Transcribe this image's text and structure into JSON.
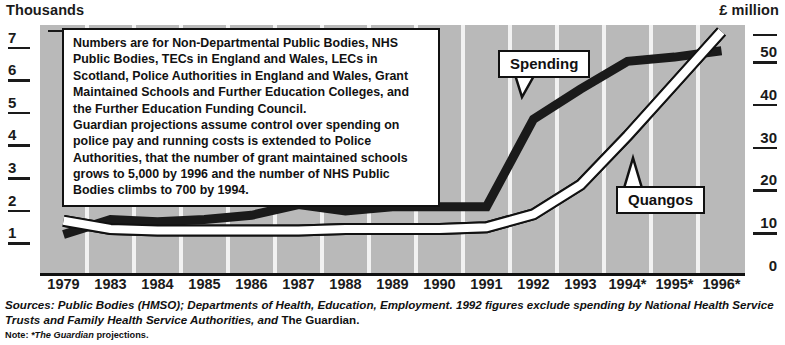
{
  "axes": {
    "left_caption": "Thousands",
    "right_caption": "£ million",
    "left_ticks": [
      "7",
      "6",
      "5",
      "4",
      "3",
      "2",
      "1"
    ],
    "right_ticks": [
      "50",
      "40",
      "30",
      "20",
      "10",
      "0"
    ],
    "x_labels": [
      "1979",
      "1983",
      "1984",
      "1985",
      "1986",
      "1987",
      "1988",
      "1989",
      "1990",
      "1991",
      "1992",
      "1993",
      "1994*",
      "1995*",
      "1996*"
    ]
  },
  "notebox": {
    "paragraph1": "Numbers are for Non-Departmental Public Bodies, NHS Public Bodies, TECs in England and Wales, LECs in Scotland, Police Authorities in England and Wales, Grant Maintained Schools and Further Education Colleges, and the Further Education Funding Council.",
    "paragraph2": "Guardian projections assume control over spending on police pay and running costs is extended to Police Authorities, that the number of grant maintained schools grows to 5,000 by 1996 and the number of NHS Public Bodies climbs to 700 by 1994."
  },
  "callouts": {
    "spending": "Spending",
    "quangos": "Quangos"
  },
  "footer": {
    "sources_italic_1": "Sources: Public Bodies (HMSO); Departments of Health, Education, Employment. 1992 figures exclude spending by National Health Service Trusts and Family Health Service Authorities, and ",
    "sources_plain": "The Guardian.",
    "note_label": "Note: ",
    "note_italic": "*The Guardian",
    "note_rest": " projections."
  },
  "colors": {
    "plot_background": "#b9b9b9",
    "gridline": "#f2f2f2",
    "spending_line": "#1a1a1a",
    "quangos_fill": "#ffffff",
    "quangos_stroke": "#111111",
    "text": "#111111"
  },
  "chart_data": {
    "type": "line",
    "title": "",
    "xlabel": "",
    "ylabel": "Thousands",
    "y2label": "£ million",
    "x": [
      "1979",
      "1983",
      "1984",
      "1985",
      "1986",
      "1987",
      "1988",
      "1989",
      "1990",
      "1991",
      "1992",
      "1993",
      "1994*",
      "1995*",
      "1996*"
    ],
    "ylim": [
      0,
      7.6
    ],
    "y2lim": [
      0,
      58
    ],
    "grid": true,
    "legend_position": "callout-annotations",
    "series": [
      {
        "name": "Quangos",
        "axis": "left",
        "unit": "thousands",
        "style": "white-filled-line",
        "values": [
          1.6,
          1.35,
          1.3,
          1.3,
          1.3,
          1.3,
          1.35,
          1.35,
          1.35,
          1.4,
          1.8,
          2.7,
          4.2,
          5.8,
          7.4
        ]
      },
      {
        "name": "Spending",
        "axis": "right",
        "unit": "£ million",
        "style": "thick-dark-line",
        "values": [
          9.0,
          12.5,
          12.0,
          12.5,
          13.5,
          16.0,
          14.5,
          15.5,
          15.5,
          15.5,
          36.0,
          43.0,
          49.5,
          50.5,
          52.0
        ]
      }
    ],
    "annotations": [
      {
        "text": "Spending",
        "points_to_series": "Spending",
        "points_to_x": "1992"
      },
      {
        "text": "Quangos",
        "points_to_series": "Quangos",
        "points_to_x": "1994*"
      }
    ]
  }
}
